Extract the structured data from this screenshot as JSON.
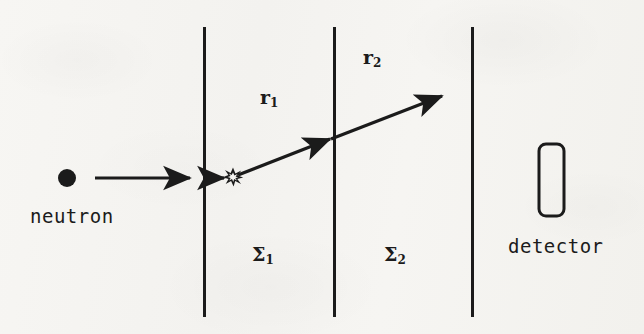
{
  "figure": {
    "background_color": "#f5f4f1",
    "ink_color": "#1b1b1b"
  },
  "labels": {
    "neutron": "neutron",
    "detector": "detector",
    "path_1_base": "r",
    "path_1_sub": "1",
    "path_2_base": "r",
    "path_2_sub": "2",
    "region_1_base": "Σ",
    "region_1_sub": "1",
    "region_2_base": "Σ",
    "region_2_sub": "2"
  },
  "geometry": {
    "walls": [
      {
        "name": "wall-left",
        "x": 204,
        "y_top": 27,
        "y_bottom": 317
      },
      {
        "name": "wall-middle",
        "x": 334,
        "y_top": 27,
        "y_bottom": 317
      },
      {
        "name": "wall-right",
        "x": 472,
        "y_top": 27,
        "y_bottom": 317
      }
    ],
    "neutron_dot": {
      "cx": 67,
      "cy": 178,
      "r": 9
    },
    "incoming_arrow": {
      "x1": 95,
      "y1": 178,
      "x2": 196,
      "y2": 178
    },
    "entry_arrow": {
      "x1": 207,
      "y1": 178,
      "x2": 228,
      "y2": 178
    },
    "collision_point": {
      "cx": 233,
      "cy": 177,
      "r": 9
    },
    "scattered_ray": {
      "x1": 238,
      "y1": 175,
      "x2": 447,
      "y2": 93
    },
    "mid_arrowhead_at": {
      "x": 334,
      "y": 137
    },
    "detector_box": {
      "x": 538,
      "y": 143,
      "width": 26,
      "height": 73,
      "radius": 7
    }
  },
  "label_positions": {
    "neutron": {
      "x": 30,
      "y": 205
    },
    "detector": {
      "x": 508,
      "y": 235
    },
    "r1": {
      "x": 260,
      "y": 92
    },
    "r2": {
      "x": 363,
      "y": 52
    },
    "sigma1": {
      "x": 252,
      "y": 249
    },
    "sigma2": {
      "x": 384,
      "y": 249
    }
  }
}
